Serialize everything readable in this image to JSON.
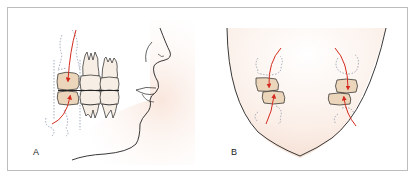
{
  "figure": {
    "panels": [
      {
        "id": "A",
        "label": "A",
        "view": "lateral profile with molars"
      },
      {
        "id": "B",
        "label": "B",
        "view": "frontal arch view with molars"
      }
    ],
    "colors": {
      "border": "#bdbdbd",
      "outline": "#222222",
      "tooth_fill_highlight": "#ecd6bb",
      "tooth_fill": "#f7efe6",
      "skin": "#fbefe8",
      "arrow": "#d42a1e",
      "dashed": "#7a8aa0"
    }
  }
}
